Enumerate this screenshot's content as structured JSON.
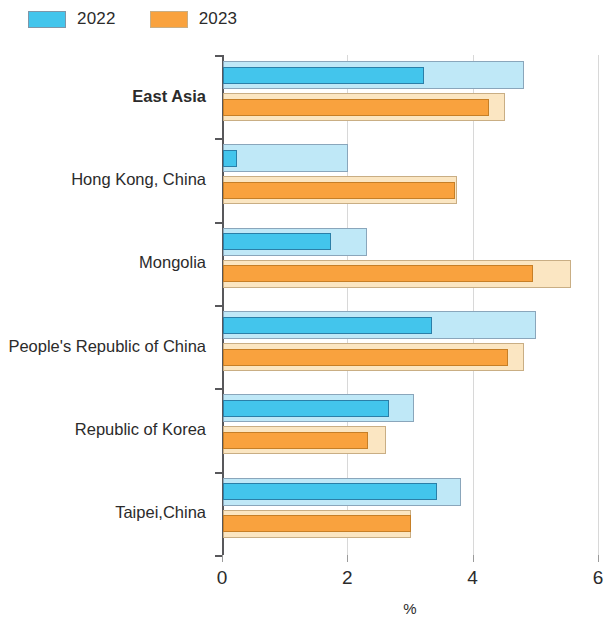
{
  "legend": {
    "items": [
      {
        "label": "2022",
        "color": "#43c5ec"
      },
      {
        "label": "2023",
        "color": "#f9a23e"
      }
    ]
  },
  "axis": {
    "x_title": "%",
    "x_ticks": [
      "0",
      "2",
      "4",
      "6"
    ]
  },
  "chart_data": {
    "type": "bar",
    "orientation": "horizontal",
    "title": "",
    "xlabel": "%",
    "ylabel": "",
    "xlim": [
      0,
      6
    ],
    "xticks": [
      0,
      2,
      4,
      6
    ],
    "grid": true,
    "legend_position": "top-left",
    "note": "Each category shows two nested bars per year: an outer pale bar and an inner saturated bar.",
    "categories": [
      "East Asia",
      "Hong Kong, China",
      "Mongolia",
      "People's Republic of China",
      "Republic of Korea",
      "Taipei,China"
    ],
    "bold_categories": [
      "East Asia"
    ],
    "series": [
      {
        "name": "2022",
        "layer": "outer",
        "color": "#bfe8f7",
        "values": [
          4.8,
          2.0,
          2.3,
          5.0,
          3.05,
          3.8
        ]
      },
      {
        "name": "2022",
        "layer": "inner",
        "color": "#43c5ec",
        "values": [
          3.2,
          0.22,
          1.73,
          3.33,
          2.65,
          3.42
        ]
      },
      {
        "name": "2023",
        "layer": "outer",
        "color": "#fbe6c2",
        "values": [
          4.5,
          3.73,
          5.55,
          4.8,
          2.6,
          3.0
        ]
      },
      {
        "name": "2023",
        "layer": "inner",
        "color": "#f9a23e",
        "values": [
          4.25,
          3.7,
          4.95,
          4.55,
          2.32,
          3.0
        ]
      }
    ]
  }
}
